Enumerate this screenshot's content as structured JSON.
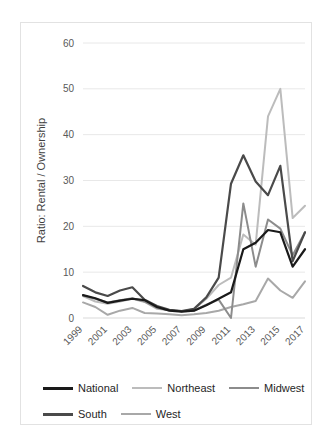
{
  "chart_data": {
    "type": "line",
    "title": "",
    "xlabel": "",
    "ylabel": "Ratio: Rental / Ownership",
    "x": [
      1999,
      2000,
      2001,
      2002,
      2003,
      2004,
      2005,
      2006,
      2007,
      2008,
      2009,
      2010,
      2011,
      2012,
      2013,
      2014,
      2015,
      2016,
      2017
    ],
    "xtick_labels": [
      "1999",
      "2001",
      "2003",
      "2005",
      "2007",
      "2009",
      "2011",
      "2013",
      "2015",
      "2017"
    ],
    "ytick_labels": [
      "0",
      "10",
      "20",
      "30",
      "40",
      "50",
      "60"
    ],
    "yticks": [
      0,
      10,
      20,
      30,
      40,
      50,
      60
    ],
    "ylim": [
      0,
      60
    ],
    "grid": "horizontal",
    "legend_position": "bottom",
    "series": [
      {
        "name": "National",
        "color": "#1a1a1a",
        "width": 2.2,
        "values": [
          5.0,
          4.3,
          3.3,
          3.8,
          4.2,
          3.9,
          2.4,
          1.6,
          1.4,
          1.6,
          2.8,
          4.2,
          5.6,
          15.0,
          16.4,
          19.2,
          18.7,
          11.2,
          15.0
        ]
      },
      {
        "name": "Northeast",
        "color": "#bcbcbc",
        "width": 2.0,
        "values": [
          4.8,
          3.6,
          3.1,
          3.6,
          4.2,
          3.5,
          2.0,
          1.7,
          1.5,
          1.9,
          4.2,
          7.2,
          8.8,
          18.2,
          16.0,
          44.0,
          50.0,
          21.8,
          24.5
        ]
      },
      {
        "name": "Midwest",
        "color": "#8c8c8c",
        "width": 2.0,
        "values": [
          4.9,
          4.2,
          3.4,
          3.9,
          4.3,
          3.6,
          2.2,
          1.7,
          1.5,
          1.6,
          2.9,
          4.0,
          0.0,
          25.0,
          11.2,
          21.5,
          19.5,
          13.7,
          18.7
        ]
      },
      {
        "name": "South",
        "color": "#4a4a4a",
        "width": 2.2,
        "values": [
          7.0,
          5.6,
          4.8,
          6.0,
          6.7,
          4.0,
          2.6,
          1.8,
          1.5,
          2.0,
          4.5,
          8.8,
          29.3,
          35.5,
          29.8,
          26.8,
          33.2,
          12.4,
          18.7
        ]
      },
      {
        "name": "West",
        "color": "#a8a8a8",
        "width": 2.0,
        "values": [
          3.4,
          2.4,
          0.7,
          1.6,
          2.2,
          1.1,
          1.0,
          0.8,
          0.6,
          0.8,
          1.1,
          1.6,
          2.4,
          3.0,
          3.7,
          8.6,
          6.0,
          4.4,
          8.0
        ]
      }
    ]
  },
  "legend": {
    "rows": [
      [
        {
          "label": "National",
          "color": "#1a1a1a",
          "width": 3.2
        },
        {
          "label": "Northeast",
          "color": "#bcbcbc",
          "width": 2.4
        },
        {
          "label": "Midwest",
          "color": "#8c8c8c",
          "width": 2.4
        }
      ],
      [
        {
          "label": "South",
          "color": "#4a4a4a",
          "width": 3.2
        },
        {
          "label": "West",
          "color": "#a8a8a8",
          "width": 2.4
        }
      ]
    ]
  }
}
